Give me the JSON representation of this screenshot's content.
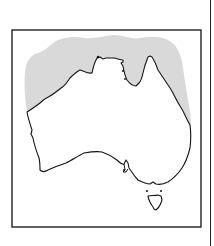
{
  "map": {
    "subject": "Australia",
    "description": "Outline map of Australia with a shaded band along the northern coastline",
    "colors": {
      "background": "#ffffff",
      "frame": "#222222",
      "coastline": "#111111",
      "shaded_region": "#d9d9d9",
      "land": "#ffffff"
    },
    "frame": {
      "x": 12,
      "y": 30,
      "width": 189,
      "height": 197
    },
    "shaded_region_label": "Northern coastal distribution area",
    "features": [
      {
        "name": "Mainland Australia"
      },
      {
        "name": "Tasmania"
      },
      {
        "name": "Cape York Peninsula"
      },
      {
        "name": "Gulf of Carpentaria"
      }
    ]
  }
}
